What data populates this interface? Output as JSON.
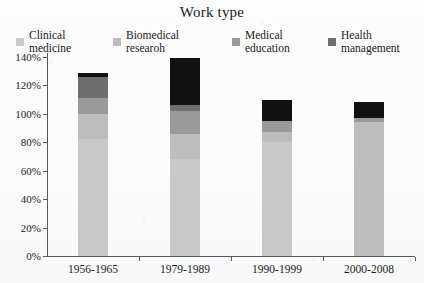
{
  "chart_data": {
    "type": "bar",
    "stacked": true,
    "title": "Work type",
    "xlabel": "",
    "ylabel": "",
    "ylim": [
      0,
      140
    ],
    "ytick_labels": [
      "0%",
      "20%",
      "40%",
      "60%",
      "80%",
      "100%",
      "120%",
      "140%"
    ],
    "ytick_values": [
      0,
      20,
      40,
      60,
      80,
      100,
      120,
      140
    ],
    "grid": false,
    "legend_position": "top",
    "categories": [
      "1956-1965",
      "1979-1989",
      "1990-1999",
      "2000-2008"
    ],
    "series": [
      {
        "name": "Clinical\nmedicine",
        "color": "#c9c9c9",
        "values": [
          82,
          68,
          80,
          0
        ]
      },
      {
        "name": "Biomedical\nresearoh",
        "color": "#bdbdbd",
        "values": [
          18,
          18,
          7,
          94
        ]
      },
      {
        "name": "Medical\neducation",
        "color": "#9a9a9a",
        "values": [
          11,
          16,
          8,
          3
        ]
      },
      {
        "name": "Health\nmanagement",
        "color": "#6e6e6e",
        "values": [
          15,
          4,
          0,
          0
        ]
      },
      {
        "name": "others",
        "color": "#111111",
        "values": [
          3,
          33,
          15,
          11
        ]
      }
    ],
    "totals": [
      129,
      139,
      110,
      108
    ]
  },
  "axis": {
    "line_color": "#555a5e"
  }
}
